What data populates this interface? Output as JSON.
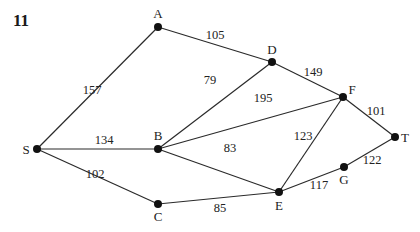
{
  "question_number": "11",
  "graph": {
    "nodes": [
      {
        "id": "S",
        "label": "S"
      },
      {
        "id": "A",
        "label": "A"
      },
      {
        "id": "B",
        "label": "B"
      },
      {
        "id": "C",
        "label": "C"
      },
      {
        "id": "D",
        "label": "D"
      },
      {
        "id": "E",
        "label": "E"
      },
      {
        "id": "F",
        "label": "F"
      },
      {
        "id": "G",
        "label": "G"
      },
      {
        "id": "T",
        "label": "T"
      }
    ],
    "edges": [
      {
        "from": "S",
        "to": "A",
        "weight": "157"
      },
      {
        "from": "S",
        "to": "B",
        "weight": "134"
      },
      {
        "from": "S",
        "to": "C",
        "weight": "102"
      },
      {
        "from": "A",
        "to": "D",
        "weight": "105"
      },
      {
        "from": "B",
        "to": "D",
        "weight": "79"
      },
      {
        "from": "B",
        "to": "F",
        "weight": "195"
      },
      {
        "from": "B",
        "to": "E",
        "weight": "83"
      },
      {
        "from": "C",
        "to": "E",
        "weight": "85"
      },
      {
        "from": "D",
        "to": "F",
        "weight": "149"
      },
      {
        "from": "E",
        "to": "F",
        "weight": "123"
      },
      {
        "from": "E",
        "to": "G",
        "weight": "117"
      },
      {
        "from": "F",
        "to": "T",
        "weight": "101"
      },
      {
        "from": "G",
        "to": "T",
        "weight": "122"
      }
    ]
  }
}
